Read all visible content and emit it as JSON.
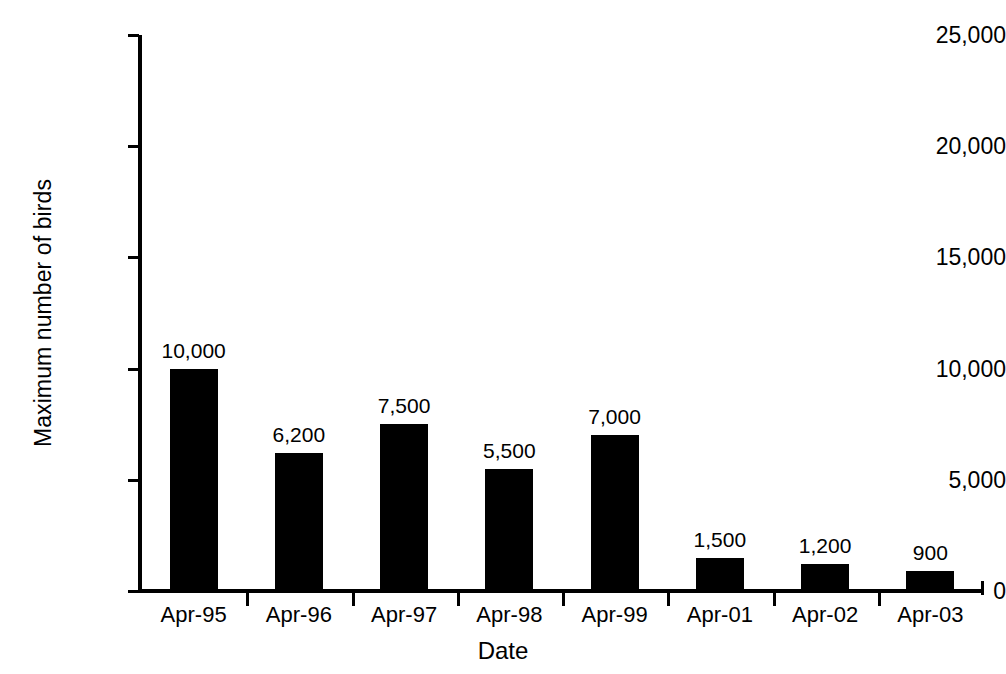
{
  "chart_data": {
    "type": "bar",
    "title": "",
    "xlabel": "Date",
    "ylabel": "Maximum number of birds",
    "categories": [
      "Apr-95",
      "Apr-96",
      "Apr-97",
      "Apr-98",
      "Apr-99",
      "Apr-01",
      "Apr-02",
      "Apr-03"
    ],
    "values": [
      10000,
      6200,
      7500,
      5500,
      7000,
      1500,
      1200,
      900
    ],
    "data_labels": [
      "10,000",
      "6,200",
      "7,500",
      "5,500",
      "7,000",
      "1,500",
      "1,200",
      "900"
    ],
    "ylim": [
      0,
      25000
    ],
    "ytick_values": [
      0,
      5000,
      10000,
      15000,
      20000,
      25000
    ],
    "ytick_labels": [
      "0",
      "5,000",
      "10,000",
      "15,000",
      "20,000",
      "25,000"
    ],
    "grid": false,
    "legend": null,
    "bar_color": "#000000",
    "background_color": "#ffffff",
    "axis_color": "#000000"
  },
  "axes": {
    "y_title": "Maximum number of birds",
    "x_title": "Date"
  },
  "y_ticks": [
    {
      "label": "25,000",
      "value": 25000
    },
    {
      "label": "20,000",
      "value": 20000
    },
    {
      "label": "15,000",
      "value": 15000
    },
    {
      "label": "10,000",
      "value": 10000
    },
    {
      "label": "5,000",
      "value": 5000
    },
    {
      "label": "0",
      "value": 0
    }
  ],
  "bars": [
    {
      "category": "Apr-95",
      "value": 10000,
      "label": "10,000"
    },
    {
      "category": "Apr-96",
      "value": 6200,
      "label": "6,200"
    },
    {
      "category": "Apr-97",
      "value": 7500,
      "label": "7,500"
    },
    {
      "category": "Apr-98",
      "value": 5500,
      "label": "5,500"
    },
    {
      "category": "Apr-99",
      "value": 7000,
      "label": "7,000"
    },
    {
      "category": "Apr-01",
      "value": 1500,
      "label": "1,500"
    },
    {
      "category": "Apr-02",
      "value": 1200,
      "label": "1,200"
    },
    {
      "category": "Apr-03",
      "value": 900,
      "label": "900"
    }
  ]
}
